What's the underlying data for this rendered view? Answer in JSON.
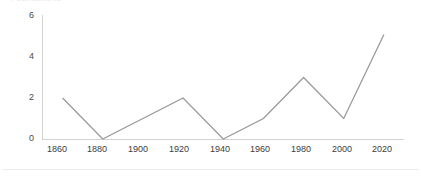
{
  "figure": {
    "clipped_title": "Publications",
    "background_color": "#ffffff",
    "line_color": "#9a9a9a",
    "axis_color": "#d2d2d2",
    "tick_label_color": "#3c3c3c"
  },
  "chart_data": {
    "type": "line",
    "title": "",
    "xlabel": "",
    "ylabel": "",
    "x": [
      1860,
      1880,
      1900,
      1920,
      1940,
      1960,
      1980,
      2000,
      2020
    ],
    "values": [
      2,
      0,
      1,
      2,
      0,
      1,
      3,
      1,
      5.1
    ],
    "xtick_labels": [
      "1860",
      "1880",
      "1900",
      "1920",
      "1940",
      "1960",
      "1980",
      "2000",
      "2020"
    ],
    "ytick_labels": [
      "0",
      "2",
      "4",
      "6"
    ],
    "yticks": [
      0,
      2,
      4,
      6
    ],
    "xlim": [
      1850,
      2030
    ],
    "ylim": [
      0,
      6
    ],
    "grid": false,
    "legend": null,
    "legend_position": "none"
  }
}
